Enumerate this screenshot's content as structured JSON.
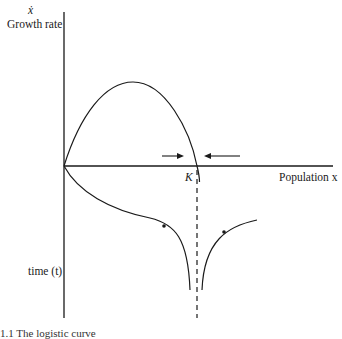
{
  "figure": {
    "y_axis": {
      "symbol": "ẋ",
      "label": "Growth rate",
      "lower_label": "time (t)"
    },
    "x_axis": {
      "label": "Population x"
    },
    "equilibrium_label": "K",
    "caption_fragment": "1.1   The logistic curve"
  },
  "colors": {
    "ink": "#1a1a1a",
    "background": "#ffffff"
  }
}
